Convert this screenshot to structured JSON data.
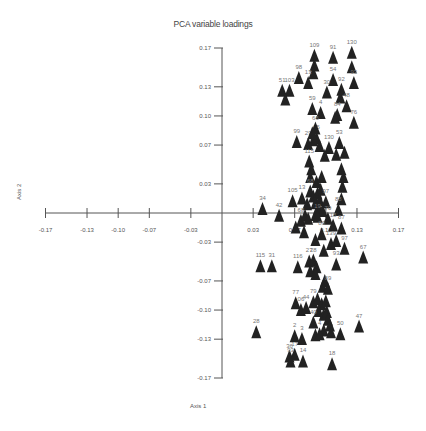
{
  "chart_data": {
    "type": "scatter",
    "title": "PCA variable loadings",
    "xlabel": "Axis 1",
    "ylabel": "Axis 2",
    "xlim": [
      -0.17,
      0.17
    ],
    "ylim": [
      -0.17,
      0.17
    ],
    "x_ticks": [
      "-0.17",
      "-0.13",
      "-0.10",
      "-0.07",
      "-0.03",
      "0.03",
      "0.07",
      "0.10",
      "0.13",
      "0.17"
    ],
    "x_tick_values": [
      -0.17,
      -0.13,
      -0.1,
      -0.07,
      -0.03,
      0.03,
      0.07,
      0.1,
      0.13,
      0.17
    ],
    "y_ticks": [
      "0.17",
      "0.13",
      "0.10",
      "0.07",
      "0.03",
      "-0.03",
      "-0.07",
      "-0.10",
      "-0.13",
      "-0.17"
    ],
    "y_tick_values": [
      0.17,
      0.13,
      0.1,
      0.07,
      0.03,
      -0.03,
      -0.07,
      -0.1,
      -0.13,
      -0.17
    ],
    "grid": false,
    "legend": null,
    "marker": "filled-triangle",
    "marker_color": "#222222",
    "label_color": "#777777",
    "axis_color": "#555555",
    "points": [
      {
        "label": "109",
        "x": 0.089,
        "y": 0.16
      },
      {
        "label": "91",
        "x": 0.107,
        "y": 0.158
      },
      {
        "label": "130",
        "x": 0.125,
        "y": 0.163
      },
      {
        "label": "",
        "x": 0.125,
        "y": 0.148
      },
      {
        "label": "",
        "x": 0.089,
        "y": 0.15
      },
      {
        "label": "",
        "x": 0.088,
        "y": 0.142
      },
      {
        "label": "98",
        "x": 0.074,
        "y": 0.137
      },
      {
        "label": "13",
        "x": 0.083,
        "y": 0.132
      },
      {
        "label": "54",
        "x": 0.107,
        "y": 0.135
      },
      {
        "label": "93",
        "x": 0.127,
        "y": 0.132
      },
      {
        "label": "51",
        "x": 0.058,
        "y": 0.124
      },
      {
        "label": "103",
        "x": 0.065,
        "y": 0.124
      },
      {
        "label": "",
        "x": 0.061,
        "y": 0.115
      },
      {
        "label": "30",
        "x": 0.101,
        "y": 0.122
      },
      {
        "label": "92",
        "x": 0.115,
        "y": 0.125
      },
      {
        "label": "",
        "x": 0.114,
        "y": 0.117
      },
      {
        "label": "48",
        "x": 0.12,
        "y": 0.108
      },
      {
        "label": "59",
        "x": 0.087,
        "y": 0.105
      },
      {
        "label": "4",
        "x": 0.095,
        "y": 0.101
      },
      {
        "label": "84",
        "x": 0.111,
        "y": 0.099
      },
      {
        "label": "",
        "x": 0.109,
        "y": 0.096
      },
      {
        "label": "76",
        "x": 0.127,
        "y": 0.091
      },
      {
        "label": "99",
        "x": 0.072,
        "y": 0.071
      },
      {
        "label": "29",
        "x": 0.083,
        "y": 0.069
      },
      {
        "label": "",
        "x": 0.088,
        "y": 0.073
      },
      {
        "label": "65",
        "x": 0.091,
        "y": 0.075
      },
      {
        "label": "",
        "x": 0.087,
        "y": 0.08
      },
      {
        "label": "66",
        "x": 0.09,
        "y": 0.085
      },
      {
        "label": "",
        "x": 0.094,
        "y": 0.067
      },
      {
        "label": "130",
        "x": 0.103,
        "y": 0.065
      },
      {
        "label": "53",
        "x": 0.113,
        "y": 0.07
      },
      {
        "label": "",
        "x": 0.118,
        "y": 0.06
      },
      {
        "label": "",
        "x": 0.11,
        "y": 0.058
      },
      {
        "label": "",
        "x": 0.099,
        "y": 0.057
      },
      {
        "label": "115",
        "x": 0.084,
        "y": 0.051
      },
      {
        "label": "",
        "x": 0.086,
        "y": 0.043
      },
      {
        "label": "",
        "x": 0.085,
        "y": 0.035
      },
      {
        "label": "",
        "x": 0.091,
        "y": 0.03
      },
      {
        "label": "",
        "x": 0.096,
        "y": 0.035
      },
      {
        "label": "",
        "x": 0.115,
        "y": 0.043
      },
      {
        "label": "",
        "x": 0.117,
        "y": 0.035
      },
      {
        "label": "",
        "x": 0.116,
        "y": 0.025
      },
      {
        "label": "68",
        "x": 0.085,
        "y": 0.02
      },
      {
        "label": "",
        "x": 0.088,
        "y": 0.015
      },
      {
        "label": "",
        "x": 0.092,
        "y": 0.018
      },
      {
        "label": "",
        "x": 0.095,
        "y": 0.022
      },
      {
        "label": "105",
        "x": 0.068,
        "y": 0.01
      },
      {
        "label": "13",
        "x": 0.077,
        "y": 0.013
      },
      {
        "label": "",
        "x": 0.082,
        "y": 0.007
      },
      {
        "label": "",
        "x": 0.09,
        "y": 0.008
      },
      {
        "label": "",
        "x": 0.094,
        "y": 0.011
      },
      {
        "label": "97",
        "x": 0.1,
        "y": 0.009
      },
      {
        "label": "",
        "x": 0.115,
        "y": 0.012
      },
      {
        "label": "",
        "x": 0.093,
        "y": 0.003
      },
      {
        "label": "",
        "x": 0.097,
        "y": 0.0
      },
      {
        "label": "34",
        "x": 0.039,
        "y": 0.002
      },
      {
        "label": "42",
        "x": 0.055,
        "y": -0.005
      },
      {
        "label": "68",
        "x": 0.076,
        "y": -0.01
      },
      {
        "label": "",
        "x": 0.08,
        "y": -0.005
      },
      {
        "label": "",
        "x": 0.083,
        "y": -0.008
      },
      {
        "label": "",
        "x": 0.09,
        "y": -0.004
      },
      {
        "label": "",
        "x": 0.071,
        "y": -0.017
      },
      {
        "label": "",
        "x": 0.079,
        "y": -0.022
      },
      {
        "label": "19",
        "x": 0.092,
        "y": -0.006
      },
      {
        "label": "70",
        "x": 0.102,
        "y": -0.008
      },
      {
        "label": "88",
        "x": 0.112,
        "y": 0.001
      },
      {
        "label": "18",
        "x": 0.107,
        "y": -0.015
      },
      {
        "label": "87",
        "x": 0.115,
        "y": -0.018
      },
      {
        "label": "80",
        "x": 0.096,
        "y": -0.024
      },
      {
        "label": "",
        "x": 0.09,
        "y": -0.03
      },
      {
        "label": "139",
        "x": 0.105,
        "y": -0.034
      },
      {
        "label": "",
        "x": 0.11,
        "y": -0.031
      },
      {
        "label": "97",
        "x": 0.118,
        "y": -0.039
      },
      {
        "label": "",
        "x": 0.098,
        "y": -0.041
      },
      {
        "label": "115",
        "x": 0.037,
        "y": -0.057
      },
      {
        "label": "31",
        "x": 0.048,
        "y": -0.057
      },
      {
        "label": "116",
        "x": 0.073,
        "y": -0.058
      },
      {
        "label": "27",
        "x": 0.084,
        "y": -0.052
      },
      {
        "label": "28",
        "x": 0.088,
        "y": -0.051
      },
      {
        "label": "",
        "x": 0.091,
        "y": -0.058
      },
      {
        "label": "",
        "x": 0.085,
        "y": -0.062
      },
      {
        "label": "",
        "x": 0.09,
        "y": -0.065
      },
      {
        "label": "93",
        "x": 0.11,
        "y": -0.055
      },
      {
        "label": "67",
        "x": 0.136,
        "y": -0.048
      },
      {
        "label": "",
        "x": 0.099,
        "y": -0.072
      },
      {
        "label": "",
        "x": 0.097,
        "y": -0.078
      },
      {
        "label": "89",
        "x": 0.102,
        "y": -0.08
      },
      {
        "label": "77",
        "x": 0.071,
        "y": -0.095
      },
      {
        "label": "06",
        "x": 0.076,
        "y": -0.102
      },
      {
        "label": "44",
        "x": 0.081,
        "y": -0.1
      },
      {
        "label": "79",
        "x": 0.088,
        "y": -0.094
      },
      {
        "label": "",
        "x": 0.092,
        "y": -0.091
      },
      {
        "label": "",
        "x": 0.096,
        "y": -0.096
      },
      {
        "label": "",
        "x": 0.1,
        "y": -0.093
      },
      {
        "label": "",
        "x": 0.093,
        "y": -0.103
      },
      {
        "label": "",
        "x": 0.098,
        "y": -0.107
      },
      {
        "label": "",
        "x": 0.101,
        "y": -0.104
      },
      {
        "label": "40",
        "x": 0.088,
        "y": -0.115
      },
      {
        "label": "",
        "x": 0.102,
        "y": -0.112
      },
      {
        "label": "",
        "x": 0.104,
        "y": -0.118
      },
      {
        "label": "",
        "x": 0.098,
        "y": -0.123
      },
      {
        "label": "28",
        "x": 0.033,
        "y": -0.125
      },
      {
        "label": "2",
        "x": 0.07,
        "y": -0.129
      },
      {
        "label": "3",
        "x": 0.077,
        "y": -0.132
      },
      {
        "label": "",
        "x": 0.09,
        "y": -0.128
      },
      {
        "label": "4",
        "x": 0.094,
        "y": -0.127
      },
      {
        "label": "",
        "x": 0.105,
        "y": -0.125
      },
      {
        "label": "50",
        "x": 0.114,
        "y": -0.127
      },
      {
        "label": "47",
        "x": 0.132,
        "y": -0.119
      },
      {
        "label": "36",
        "x": 0.065,
        "y": -0.15
      },
      {
        "label": "17",
        "x": 0.07,
        "y": -0.148
      },
      {
        "label": "93",
        "x": 0.066,
        "y": -0.155
      },
      {
        "label": "14",
        "x": 0.078,
        "y": -0.155
      },
      {
        "label": "18",
        "x": 0.106,
        "y": -0.158
      }
    ]
  }
}
